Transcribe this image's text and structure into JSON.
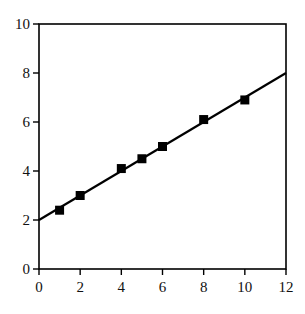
{
  "chart_data": {
    "type": "scatter",
    "title": "",
    "xlabel": "",
    "ylabel": "",
    "xlim": [
      0,
      12
    ],
    "ylim": [
      0,
      10
    ],
    "xticks": [
      0,
      2,
      4,
      6,
      8,
      10,
      12
    ],
    "yticks": [
      0,
      2,
      4,
      6,
      8,
      10
    ],
    "grid": false,
    "legend": null,
    "series": [
      {
        "name": "data",
        "marker": "square",
        "color": "#000000",
        "x": [
          1,
          2,
          4,
          5,
          6,
          8,
          10
        ],
        "y": [
          2.4,
          3.0,
          4.1,
          4.5,
          5.0,
          6.1,
          6.9
        ]
      },
      {
        "name": "fit",
        "type": "line",
        "color": "#000000",
        "x": [
          0,
          12
        ],
        "y": [
          2.0,
          8.0
        ],
        "equation": "y = 2 + 0.5x"
      }
    ]
  },
  "layout": {
    "plot": {
      "left": 39,
      "top": 24,
      "right": 286,
      "bottom": 269
    },
    "marker_size": 9,
    "colors": {
      "axis": "#000000",
      "background": "#ffffff"
    }
  }
}
